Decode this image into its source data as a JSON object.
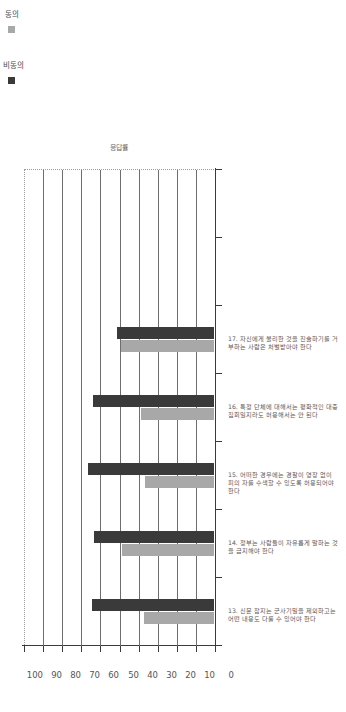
{
  "chart_data": {
    "type": "bar",
    "title": "",
    "xlabel": "",
    "ylabel": "응답률",
    "ylim": [
      0,
      100
    ],
    "ytick_step": 10,
    "yticks": [
      0,
      10,
      20,
      30,
      40,
      50,
      60,
      70,
      80,
      90,
      100
    ],
    "grid": true,
    "legend_position": "top-right",
    "orientation": "vertical-bars-page-rotated-90",
    "categories": [
      "13. 신문 잡지는 군사기밀을 제외하고는\n어떤 내용도 다룰 수 있어야 한다",
      "14. 정부는 사람들이 자유롭게 말하는 것을\n금지해야 한다",
      "15. 어떠한 경우에는 경찰이 영장 없이 피의\n자를 수색할 수 있도록 허용되어야 한다",
      "16. 특정 단체에 대해서는 평화적인\n대중집회일지라도 허용해서는 안 된다",
      "17. 자신에게 불리한 것을 진술하기를\n거부하는 사람은 처벌받아야 한다"
    ],
    "series": [
      {
        "name": "동의",
        "color": "#a8a8a8",
        "values": [
          36.5,
          48.0,
          36.0,
          38.0,
          48.5
        ]
      },
      {
        "name": "비동의",
        "color": "#3a3a3a",
        "values": [
          64.0,
          63.0,
          66.0,
          63.5,
          51.0
        ]
      }
    ]
  },
  "legend": {
    "items": [
      {
        "label": "비동의",
        "color": "#3a3a3a"
      },
      {
        "label": "동의",
        "color": "#a8a8a8"
      }
    ]
  },
  "axis": {
    "value_title": "응답률",
    "ticks": [
      "0",
      "10",
      "20",
      "30",
      "40",
      "50",
      "60",
      "70",
      "80",
      "90",
      "100"
    ]
  },
  "footer": {
    "page_number": "009"
  }
}
